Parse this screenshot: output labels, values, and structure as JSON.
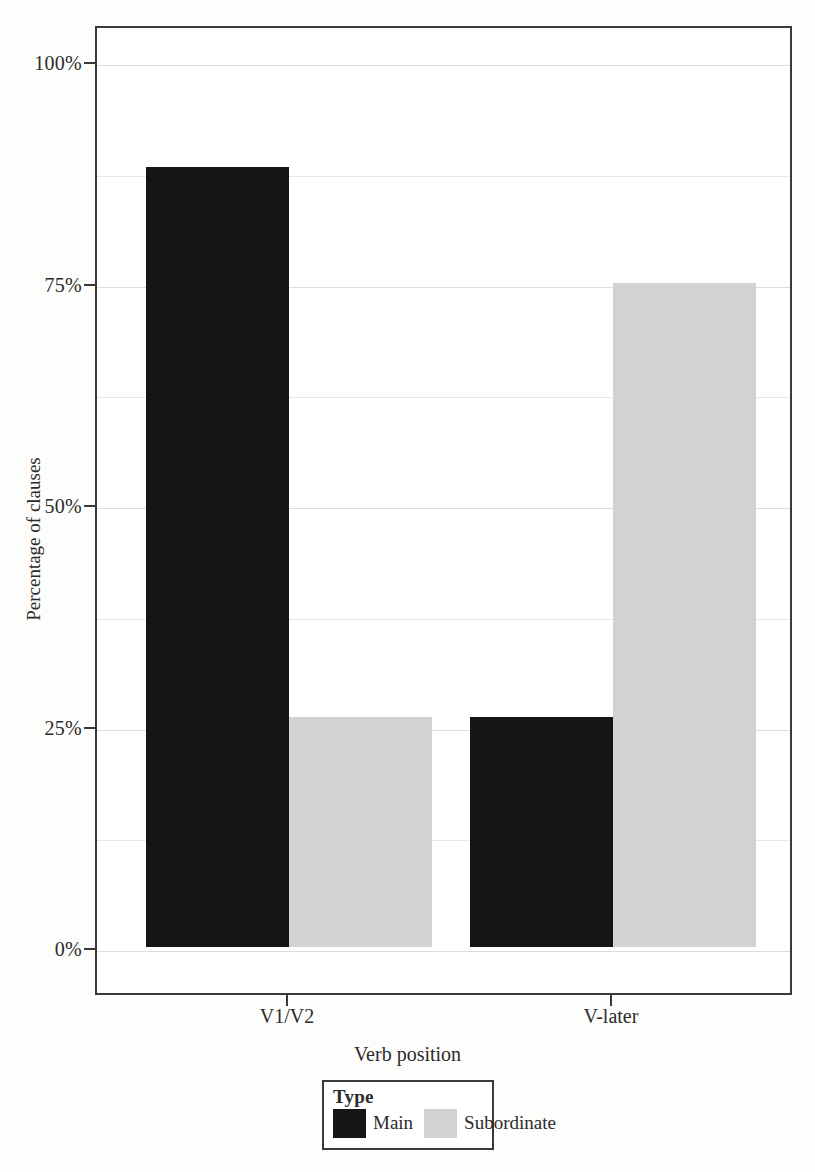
{
  "chart_data": {
    "type": "bar",
    "title": "",
    "xlabel": "Verb position",
    "ylabel": "Percentage of clauses",
    "categories": [
      "V1/V2",
      "V-later"
    ],
    "series": [
      {
        "name": "Main",
        "color": "#151515",
        "values": [
          88,
          26
        ]
      },
      {
        "name": "Subordinate",
        "color": "#d2d2d2",
        "values": [
          26,
          75
        ]
      }
    ],
    "ylim": [
      0,
      100
    ],
    "yticks": [
      0,
      25,
      50,
      75,
      100
    ],
    "ytick_labels": [
      "0%",
      "25%",
      "50%",
      "75%",
      "100%"
    ],
    "minor_gridlines": [
      12.5,
      37.5,
      62.5,
      87.5
    ],
    "grid": true,
    "legend": {
      "title": "Type",
      "position": "bottom",
      "entries": [
        {
          "label": "Main",
          "color": "#151515"
        },
        {
          "label": "Subordinate",
          "color": "#d2d2d2"
        }
      ]
    },
    "bars": [
      {
        "category": "V1/V2",
        "series": "Main",
        "value": 88
      },
      {
        "category": "V1/V2",
        "series": "Subordinate",
        "value": 26
      },
      {
        "category": "V-later",
        "series": "Main",
        "value": 12
      },
      {
        "category": "V-later",
        "series": "Subordinate",
        "value": 75
      }
    ]
  },
  "axes": {
    "y": {
      "title": "Percentage of clauses",
      "ticks": [
        {
          "label": "100%",
          "value": 100
        },
        {
          "label": "75%",
          "value": 75
        },
        {
          "label": "50%",
          "value": 50
        },
        {
          "label": "25%",
          "value": 25
        },
        {
          "label": "0%",
          "value": 0
        }
      ]
    },
    "x": {
      "title": "Verb position",
      "ticks": [
        {
          "label": "V1/V2"
        },
        {
          "label": "V-later"
        }
      ]
    }
  },
  "legend": {
    "title": "Type",
    "entries": [
      {
        "label": "Main"
      },
      {
        "label": "Subordinate"
      }
    ]
  },
  "colors": {
    "main": "#151515",
    "subordinate": "#d2d2d2",
    "axis": "#3a3a3a",
    "gridline": "#e8e8e8",
    "background": "#ffffff"
  }
}
